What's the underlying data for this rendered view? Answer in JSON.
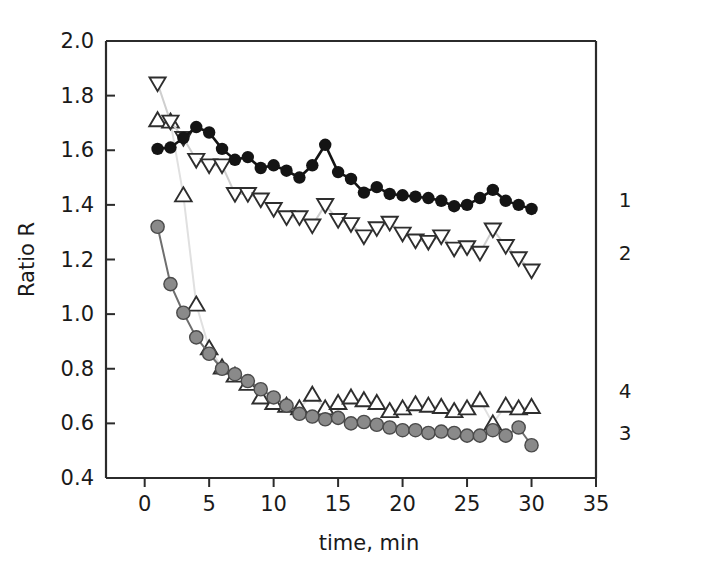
{
  "chart_data": {
    "type": "line",
    "title": "",
    "xlabel": "time, min",
    "ylabel": "Ratio R",
    "xlim": [
      -3,
      35
    ],
    "ylim": [
      0.4,
      2.0
    ],
    "xticks": [
      0,
      5,
      10,
      15,
      20,
      25,
      30,
      35
    ],
    "yticks": [
      0.4,
      0.6,
      0.8,
      1.0,
      1.2,
      1.4,
      1.6,
      1.8,
      2.0
    ],
    "xtick_labels": [
      "0",
      "5",
      "10",
      "15",
      "20",
      "25",
      "30",
      "35"
    ],
    "ytick_labels": [
      "0.4",
      "0.6",
      "0.8",
      "1.0",
      "1.2",
      "1.4",
      "1.6",
      "1.8",
      "2.0"
    ],
    "grid": false,
    "legend_position": "right-inline",
    "series": [
      {
        "name": "1",
        "label": "1",
        "marker": "filled-circle",
        "marker_color": "#141414",
        "line_color": "#141414",
        "x": [
          1,
          2,
          3,
          4,
          5,
          6,
          7,
          8,
          9,
          10,
          11,
          12,
          13,
          14,
          15,
          16,
          17,
          18,
          19,
          20,
          21,
          22,
          23,
          24,
          25,
          26,
          27,
          28,
          29,
          30
        ],
        "values": [
          1.605,
          1.61,
          1.645,
          1.685,
          1.665,
          1.605,
          1.565,
          1.575,
          1.535,
          1.545,
          1.525,
          1.5,
          1.545,
          1.62,
          1.52,
          1.495,
          1.445,
          1.465,
          1.44,
          1.435,
          1.43,
          1.425,
          1.415,
          1.395,
          1.4,
          1.425,
          1.455,
          1.415,
          1.4,
          1.385
        ]
      },
      {
        "name": "2",
        "label": "2",
        "marker": "open-down-triangle",
        "marker_color": "#ffffff",
        "marker_edge": "#2e2e2e",
        "line_color": "#cfcfcf",
        "x": [
          1,
          2,
          3,
          4,
          5,
          6,
          7,
          8,
          9,
          10,
          11,
          12,
          13,
          14,
          15,
          16,
          17,
          18,
          19,
          20,
          21,
          22,
          23,
          24,
          25,
          26,
          27,
          28,
          29,
          30
        ],
        "values": [
          1.845,
          1.705,
          1.645,
          1.565,
          1.545,
          1.545,
          1.44,
          1.44,
          1.42,
          1.385,
          1.355,
          1.355,
          1.325,
          1.4,
          1.345,
          1.33,
          1.285,
          1.315,
          1.335,
          1.295,
          1.27,
          1.265,
          1.285,
          1.24,
          1.245,
          1.225,
          1.31,
          1.25,
          1.205,
          1.16
        ]
      },
      {
        "name": "3",
        "label": "3",
        "marker": "gray-circle",
        "marker_color": "#8a8a8a",
        "marker_edge": "#4a4a4a",
        "line_color": "#6e6e6e",
        "x": [
          1,
          2,
          3,
          4,
          5,
          6,
          7,
          8,
          9,
          10,
          11,
          12,
          13,
          14,
          15,
          16,
          17,
          18,
          19,
          20,
          21,
          22,
          23,
          24,
          25,
          26,
          27,
          28,
          29,
          30
        ],
        "values": [
          1.32,
          1.11,
          1.005,
          0.915,
          0.855,
          0.8,
          0.78,
          0.755,
          0.725,
          0.695,
          0.665,
          0.635,
          0.625,
          0.615,
          0.62,
          0.6,
          0.605,
          0.595,
          0.585,
          0.575,
          0.575,
          0.565,
          0.57,
          0.565,
          0.555,
          0.555,
          0.575,
          0.555,
          0.585,
          0.52
        ]
      },
      {
        "name": "4",
        "label": "4",
        "marker": "open-up-triangle",
        "marker_color": "#ffffff",
        "marker_edge": "#2e2e2e",
        "line_color": "#e0e0e0",
        "x": [
          1,
          2,
          3,
          4,
          5,
          6,
          7,
          8,
          9,
          10,
          11,
          12,
          13,
          14,
          15,
          16,
          17,
          18,
          19,
          20,
          21,
          22,
          23,
          24,
          25,
          26,
          27,
          28,
          29,
          30
        ],
        "values": [
          1.71,
          1.705,
          1.435,
          1.035,
          0.875,
          0.805,
          0.775,
          0.745,
          0.695,
          0.675,
          0.665,
          0.655,
          0.705,
          0.655,
          0.675,
          0.695,
          0.685,
          0.675,
          0.645,
          0.655,
          0.67,
          0.665,
          0.66,
          0.645,
          0.655,
          0.685,
          0.6,
          0.665,
          0.655,
          0.66
        ]
      }
    ]
  }
}
